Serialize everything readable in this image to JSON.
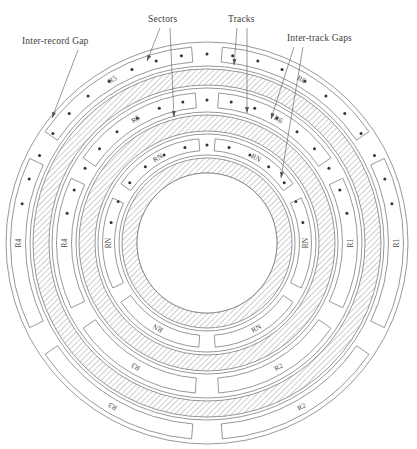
{
  "figure": {
    "center": {
      "x": 207,
      "y": 243
    },
    "colors": {
      "line": "#6b6b6b",
      "text": "#3d3d3d",
      "hatch": "#8a8a8a",
      "dot": "#333333",
      "background": "#ffffff"
    }
  },
  "callouts": [
    {
      "id": "inter-record-gap",
      "label": "Inter-record Gap",
      "text_x": 22,
      "text_y": 44,
      "leaders": [
        {
          "x1": 78,
          "y1": 50,
          "x2": 52,
          "y2": 118
        }
      ]
    },
    {
      "id": "sectors",
      "label": "Sectors",
      "text_x": 148,
      "text_y": 22,
      "leaders": [
        {
          "x1": 160,
          "y1": 28,
          "x2": 147,
          "y2": 61
        },
        {
          "x1": 170,
          "y1": 28,
          "x2": 174,
          "y2": 117
        }
      ]
    },
    {
      "id": "tracks",
      "label": "Tracks",
      "text_x": 228,
      "text_y": 22,
      "leaders": [
        {
          "x1": 237,
          "y1": 28,
          "x2": 234,
          "y2": 65
        },
        {
          "x1": 247,
          "y1": 28,
          "x2": 247,
          "y2": 113
        }
      ]
    },
    {
      "id": "inter-track-gaps",
      "label": "Inter-track Gaps",
      "text_x": 287,
      "text_y": 41,
      "leaders": [
        {
          "x1": 294,
          "y1": 47,
          "x2": 271,
          "y2": 119
        },
        {
          "x1": 303,
          "y1": 47,
          "x2": 281,
          "y2": 178
        }
      ]
    }
  ],
  "rings": [
    {
      "id": "track-outer",
      "type": "track",
      "r_outer": 201,
      "r_inner": 177,
      "sector_labels": [
        "R1",
        "R2",
        "R3",
        "R4",
        "R5",
        "R6"
      ],
      "sector_count": 6
    },
    {
      "id": "gap-outer",
      "type": "inter-track-gap",
      "r_outer": 174,
      "r_inner": 158
    },
    {
      "id": "track-middle",
      "type": "track",
      "r_outer": 155,
      "r_inner": 131,
      "sector_labels": [
        "R1",
        "R2",
        "R3",
        "R4",
        "R5",
        "R6"
      ],
      "sector_count": 6
    },
    {
      "id": "gap-middle",
      "type": "inter-track-gap",
      "r_outer": 128,
      "r_inner": 112
    },
    {
      "id": "track-inner",
      "type": "track",
      "r_outer": 109,
      "r_inner": 88,
      "sector_labels": [
        "RN",
        "RN",
        "RN",
        "RN",
        "RN",
        "RN"
      ],
      "sector_count": 6
    },
    {
      "id": "gap-inner",
      "type": "inter-track-gap",
      "r_outer": 85,
      "r_inner": 70
    },
    {
      "id": "hub",
      "type": "hub",
      "r_outer": 70,
      "r_inner": 0
    }
  ],
  "dotted_track_arcs": [
    {
      "id": "dots-outer",
      "radius": 189,
      "dot_count": 21
    },
    {
      "id": "dots-middle",
      "radius": 143,
      "dot_count": 17
    },
    {
      "id": "dots-inner",
      "radius": 98,
      "dot_count": 13
    }
  ]
}
